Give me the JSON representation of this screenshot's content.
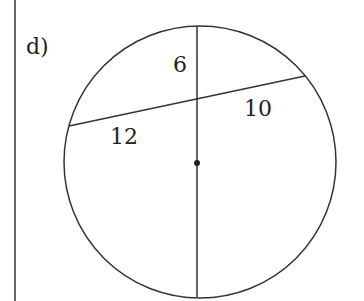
{
  "problem": {
    "label": "d)"
  },
  "diagram": {
    "segments": {
      "upper_vertical": "6",
      "right_slant": "10",
      "left_slant": "12"
    },
    "colors": {
      "stroke": "#333333",
      "text": "#222222",
      "background": "#ffffff"
    }
  }
}
